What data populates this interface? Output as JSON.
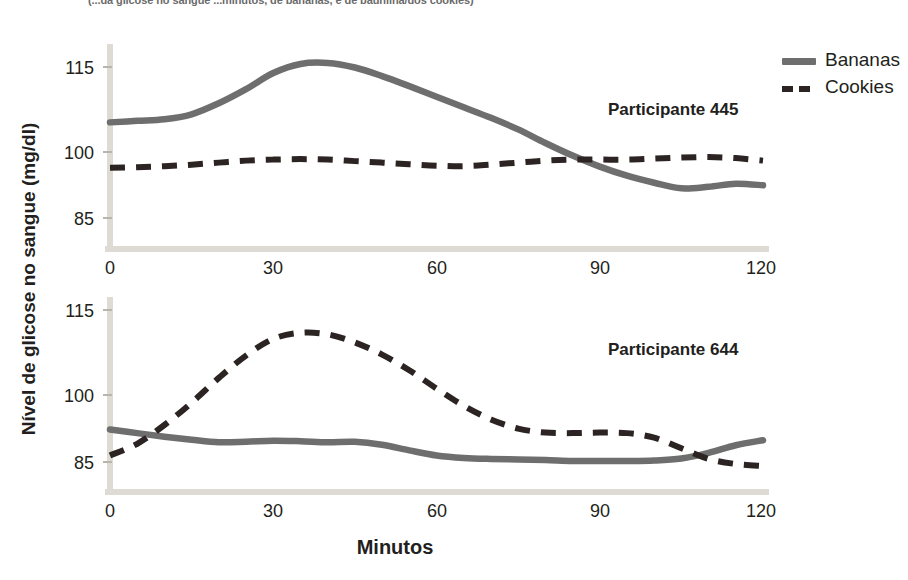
{
  "figure": {
    "clipped_top_caption": "(...da glicose no sangue ...minutos, de bananas, e de baunilha/dos cookies)",
    "y_axis_title": "Nível de glicose no sangue (mg/dl)",
    "x_axis_title": "Minutos"
  },
  "legend": {
    "position": "top-right",
    "items": [
      {
        "label": "Bananas",
        "style": "solid",
        "color": "#6e6e6e",
        "swatch_icon": "solid-line-swatch"
      },
      {
        "label": "Cookies",
        "style": "dashed",
        "color": "#2b2422",
        "swatch_icon": "dashed-line-swatch"
      }
    ]
  },
  "panels": [
    {
      "id": "445",
      "title": "Participante 445",
      "y_ticks": [
        "115",
        "100",
        "85"
      ],
      "x_ticks": [
        "0",
        "30",
        "60",
        "90",
        "120"
      ]
    },
    {
      "id": "644",
      "title": "Participante 644",
      "y_ticks": [
        "115",
        "100",
        "85"
      ],
      "x_ticks": [
        "0",
        "30",
        "60",
        "90",
        "120"
      ]
    }
  ],
  "chart_data": {
    "type": "line",
    "xlabel": "Minutos",
    "ylabel": "Nível de glicose no sangue (mg/dl)",
    "xlim": [
      0,
      120
    ],
    "ylim": [
      78.4,
      118
    ],
    "grid": false,
    "legend_position": "top-right",
    "x_ticks": [
      0,
      30,
      60,
      90,
      120
    ],
    "y_ticks": [
      85,
      100,
      115
    ],
    "subplots": [
      {
        "panel": "Participante 445",
        "x": [
          0,
          5,
          10,
          15,
          20,
          25,
          30,
          35,
          40,
          45,
          50,
          55,
          60,
          65,
          70,
          75,
          80,
          85,
          90,
          95,
          100,
          105,
          110,
          115,
          120
        ],
        "series": [
          {
            "name": "Bananas",
            "style": "solid",
            "color": "#6e6e6e",
            "values": [
              104.0,
              104.3,
              104.6,
              105.6,
              107.8,
              110.6,
              113.8,
              115.6,
              115.8,
              114.9,
              113.2,
              111.2,
              109.1,
              107.0,
              104.9,
              102.6,
              99.9,
              97.4,
              95.2,
              93.4,
              92.0,
              90.9,
              91.2,
              91.8,
              91.5
            ]
          },
          {
            "name": "Cookies",
            "style": "dashed",
            "color": "#2b2422",
            "values": [
              95.0,
              95.1,
              95.3,
              95.6,
              96.0,
              96.4,
              96.6,
              96.7,
              96.6,
              96.3,
              96.0,
              95.7,
              95.4,
              95.3,
              95.6,
              96.0,
              96.4,
              96.6,
              96.6,
              96.6,
              96.8,
              97.0,
              97.1,
              96.9,
              96.4
            ]
          }
        ]
      },
      {
        "panel": "Participante 644",
        "x": [
          0,
          5,
          10,
          15,
          20,
          25,
          30,
          35,
          40,
          45,
          50,
          55,
          60,
          65,
          70,
          75,
          80,
          85,
          90,
          95,
          100,
          105,
          110,
          115,
          120
        ],
        "series": [
          {
            "name": "Bananas",
            "style": "solid",
            "color": "#6e6e6e",
            "values": [
              91.4,
              90.7,
              90.0,
              89.4,
              88.9,
              89.0,
              89.2,
              89.1,
              88.9,
              89.0,
              88.4,
              87.3,
              86.3,
              85.8,
              85.6,
              85.5,
              85.4,
              85.2,
              85.2,
              85.2,
              85.3,
              85.7,
              86.8,
              88.3,
              89.3
            ]
          },
          {
            "name": "Cookies",
            "style": "dashed",
            "color": "#2b2422",
            "values": [
              86.3,
              88.6,
              92.3,
              96.7,
              101.6,
              106.0,
              109.3,
              110.5,
              110.2,
              108.6,
              106.2,
              103.1,
              99.5,
              96.1,
              93.4,
              91.6,
              90.8,
              90.7,
              90.8,
              90.7,
              89.8,
              87.7,
              85.6,
              84.6,
              84.2
            ]
          }
        ]
      }
    ]
  }
}
